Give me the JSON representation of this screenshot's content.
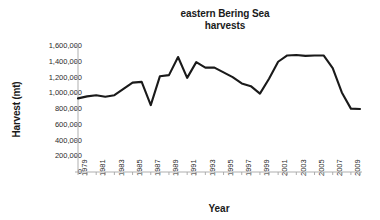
{
  "chart_data": {
    "type": "line",
    "title": "eastern Bering Sea harvests",
    "title_lines": [
      "eastern Bering Sea",
      "harvests"
    ],
    "xlabel": "Year",
    "ylabel": "Harvest (mt)",
    "ylim": [
      0,
      1600000
    ],
    "xlim": [
      1979,
      2010
    ],
    "ytick_labels": [
      "1,600,000",
      "1,400,000",
      "1,200,000",
      "1,000,000",
      "800,000",
      "600,000",
      "400,000",
      "200,000",
      "0"
    ],
    "ytick_values": [
      1600000,
      1400000,
      1200000,
      1000000,
      800000,
      600000,
      400000,
      200000,
      0
    ],
    "xtick_labels": [
      "1979",
      "1981",
      "1983",
      "1985",
      "1987",
      "1989",
      "1991",
      "1993",
      "1995",
      "1997",
      "1999",
      "2001",
      "2003",
      "2005",
      "2007",
      "2009"
    ],
    "xtick_values": [
      1979,
      1981,
      1983,
      1985,
      1987,
      1989,
      1991,
      1993,
      1995,
      1997,
      1999,
      2001,
      2003,
      2005,
      2007,
      2009
    ],
    "grid": false,
    "legend": false,
    "line_color": "#1a1a1a",
    "axis_color": "#a6a6a6",
    "background": "#ffffff",
    "x": [
      1979,
      1980,
      1981,
      1982,
      1983,
      1984,
      1985,
      1986,
      1987,
      1988,
      1989,
      1990,
      1991,
      1992,
      1993,
      1994,
      1995,
      1996,
      1997,
      1998,
      1999,
      2000,
      2001,
      2002,
      2003,
      2004,
      2005,
      2006,
      2007,
      2008,
      2009,
      2010
    ],
    "values": [
      935000,
      960000,
      975000,
      955000,
      975000,
      1055000,
      1135000,
      1145000,
      850000,
      1215000,
      1230000,
      1460000,
      1195000,
      1395000,
      1325000,
      1325000,
      1265000,
      1205000,
      1125000,
      1090000,
      995000,
      1185000,
      1400000,
      1480000,
      1485000,
      1475000,
      1480000,
      1480000,
      1320000,
      1010000,
      805000,
      800000
    ],
    "series": [
      {
        "name": "eastern Bering Sea harvests",
        "values": [
          935000,
          960000,
          975000,
          955000,
          975000,
          1055000,
          1135000,
          1145000,
          850000,
          1215000,
          1230000,
          1460000,
          1195000,
          1395000,
          1325000,
          1325000,
          1265000,
          1205000,
          1125000,
          1090000,
          995000,
          1185000,
          1400000,
          1480000,
          1485000,
          1475000,
          1480000,
          1480000,
          1320000,
          1010000,
          805000,
          800000
        ]
      }
    ]
  }
}
